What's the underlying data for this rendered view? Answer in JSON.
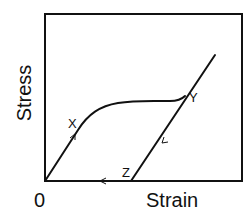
{
  "diagram": {
    "type": "stress-strain curve (loading and unloading)",
    "axes": {
      "y_label": "Stress",
      "x_label": "Strain",
      "origin_label": "0"
    },
    "points": {
      "X": "X",
      "Y": "Y",
      "Z": "Z"
    },
    "paths": [
      {
        "name": "loading-linear",
        "from": "0",
        "to": "X",
        "arrow": "up"
      },
      {
        "name": "loading-plastic",
        "from": "X",
        "to": "Y"
      },
      {
        "name": "unloading",
        "from": "Y",
        "to": "Z",
        "arrow": "down"
      },
      {
        "name": "return-along-strain-axis",
        "from": "Z",
        "to": "0",
        "arrow": "left"
      }
    ],
    "colors": {
      "line": "#111111",
      "background": "#ffffff"
    }
  }
}
